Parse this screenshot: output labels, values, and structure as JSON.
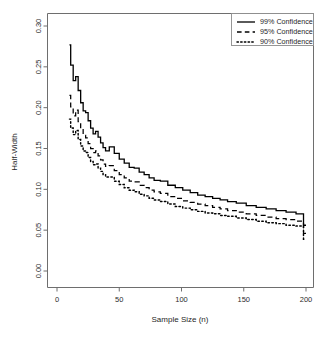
{
  "chart_data": {
    "type": "line",
    "title": "",
    "xlabel": "Sample Size (n)",
    "ylabel": "Half-Width",
    "xlim": [
      0,
      210
    ],
    "ylim": [
      0.0,
      0.305
    ],
    "xticks": [
      0,
      50,
      100,
      150,
      200
    ],
    "xtick_labels": [
      "0",
      "50",
      "100",
      "150",
      "200"
    ],
    "yticks": [
      0.0,
      0.05,
      0.1,
      0.15,
      0.2,
      0.25,
      0.3
    ],
    "ytick_labels": [
      "0.00",
      "0.05",
      "0.10",
      "0.15",
      "0.20",
      "0.25",
      "0.30"
    ],
    "grid": false,
    "legend_position": "top-right",
    "x": [
      10,
      12,
      14,
      16,
      18,
      20,
      22,
      24,
      26,
      28,
      30,
      32,
      34,
      36,
      38,
      40,
      44,
      48,
      52,
      56,
      60,
      64,
      68,
      72,
      76,
      80,
      86,
      92,
      98,
      104,
      110,
      116,
      122,
      128,
      134,
      140,
      148,
      156,
      164,
      172,
      180,
      188,
      196,
      200
    ],
    "series": [
      {
        "name": "99% Confidence",
        "label": "99% Confidence",
        "style": "solid",
        "color": "#000000",
        "values": [
          0.277,
          0.252,
          0.233,
          0.238,
          0.221,
          0.206,
          0.196,
          0.194,
          0.184,
          0.175,
          0.168,
          0.171,
          0.164,
          0.157,
          0.151,
          0.147,
          0.152,
          0.144,
          0.137,
          0.132,
          0.127,
          0.126,
          0.121,
          0.118,
          0.114,
          0.111,
          0.11,
          0.105,
          0.102,
          0.099,
          0.096,
          0.093,
          0.091,
          0.089,
          0.087,
          0.085,
          0.083,
          0.08,
          0.078,
          0.076,
          0.074,
          0.072,
          0.07,
          0.056
        ]
      },
      {
        "name": "95% Confidence",
        "label": "95% Confidence",
        "style": "dashed",
        "color": "#000000",
        "values": [
          0.215,
          0.201,
          0.19,
          0.197,
          0.183,
          0.173,
          0.166,
          0.163,
          0.156,
          0.15,
          0.145,
          0.147,
          0.141,
          0.136,
          0.131,
          0.128,
          0.129,
          0.123,
          0.118,
          0.114,
          0.11,
          0.109,
          0.105,
          0.102,
          0.099,
          0.097,
          0.095,
          0.091,
          0.089,
          0.086,
          0.084,
          0.082,
          0.08,
          0.078,
          0.076,
          0.074,
          0.072,
          0.07,
          0.068,
          0.066,
          0.064,
          0.063,
          0.061,
          0.046
        ]
      },
      {
        "name": "90% Confidence",
        "label": "90% Confidence",
        "style": "dotted",
        "color": "#000000",
        "values": [
          0.186,
          0.175,
          0.167,
          0.172,
          0.161,
          0.153,
          0.147,
          0.145,
          0.139,
          0.134,
          0.13,
          0.131,
          0.126,
          0.122,
          0.118,
          0.115,
          0.115,
          0.11,
          0.106,
          0.102,
          0.099,
          0.097,
          0.094,
          0.092,
          0.089,
          0.087,
          0.085,
          0.082,
          0.079,
          0.077,
          0.075,
          0.073,
          0.071,
          0.07,
          0.068,
          0.067,
          0.065,
          0.063,
          0.061,
          0.059,
          0.058,
          0.056,
          0.055,
          0.039
        ]
      }
    ]
  },
  "legend": {
    "entries": [
      {
        "label": "99% Confidence",
        "style": "solid"
      },
      {
        "label": "95% Confidence",
        "style": "dashed"
      },
      {
        "label": "90% Confidence",
        "style": "dotted"
      }
    ]
  }
}
